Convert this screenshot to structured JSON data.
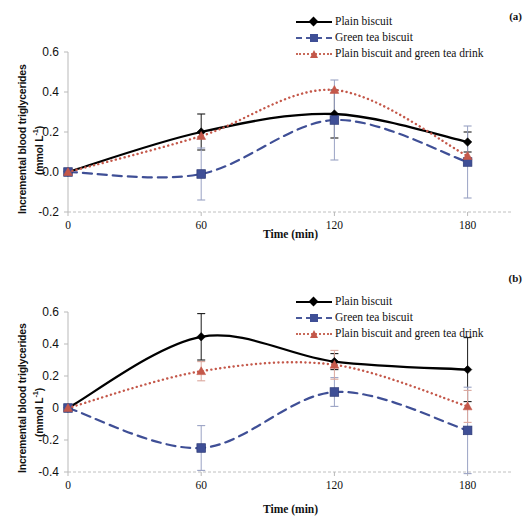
{
  "figure": {
    "panels": [
      {
        "tag": "(a)",
        "axis": {
          "y_label_line1": "Incremental blood triglycerides",
          "y_label_line2": "(mmol L",
          "y_label_sup": "-1",
          "y_label_line2_close": ")",
          "x_label": "Time (min)",
          "y_ticks": [
            "0.6",
            "0.4",
            "0.2",
            "0.0",
            "-0.2"
          ],
          "x_ticks": [
            "0",
            "60",
            "120",
            "180"
          ]
        },
        "legend": [
          {
            "label": "Plain biscuit",
            "style": "solid",
            "marker": "diamond",
            "color": "#000000"
          },
          {
            "label": "Green tea biscuit",
            "style": "dashed",
            "marker": "square",
            "color": "#3f4f96"
          },
          {
            "label": "Plain biscuit and green tea drink",
            "style": "dotted",
            "marker": "triangle",
            "color": "#c4584a"
          }
        ]
      },
      {
        "tag": "(b)",
        "axis": {
          "y_label_line1": "Incremental blood triglycerides",
          "y_label_line2": "(mmol L",
          "y_label_sup": "-1",
          "y_label_line2_close": ")",
          "x_label": "Time (min)",
          "y_ticks": [
            "0.6",
            "0.4",
            "0.2",
            "0",
            "-0.2",
            "-0.4"
          ],
          "x_ticks": [
            "0",
            "60",
            "120",
            "180"
          ]
        },
        "legend": [
          {
            "label": "Plain biscuit",
            "style": "solid",
            "marker": "diamond",
            "color": "#000000"
          },
          {
            "label": "Green tea biscuit",
            "style": "dashed",
            "marker": "square",
            "color": "#3f4f96"
          },
          {
            "label": "Plain biscuit and green tea drink",
            "style": "dotted",
            "marker": "triangle",
            "color": "#c4584a"
          }
        ]
      }
    ]
  },
  "chart_data": [
    {
      "type": "line",
      "panel": "(a)",
      "title": "",
      "xlabel": "Time (min)",
      "ylabel": "Incremental blood triglycerides (mmol L-1)",
      "x": [
        0,
        60,
        120,
        180
      ],
      "xlim": [
        0,
        200
      ],
      "ylim": [
        -0.2,
        0.6
      ],
      "yticks": [
        -0.2,
        0.0,
        0.2,
        0.4,
        0.6
      ],
      "xticks": [
        0,
        60,
        120,
        180
      ],
      "grid": false,
      "legend_position": "top-right",
      "smoothed": true,
      "series": [
        {
          "name": "Plain biscuit",
          "color": "#000000",
          "style": "solid",
          "marker": "diamond",
          "values": [
            0.0,
            0.2,
            0.29,
            0.15
          ],
          "errors": [
            0.0,
            0.09,
            0.12,
            0.05
          ]
        },
        {
          "name": "Green tea biscuit",
          "color": "#3f4f96",
          "style": "dashed",
          "marker": "square",
          "values": [
            0.0,
            -0.01,
            0.26,
            0.05
          ],
          "errors": [
            0.0,
            0.13,
            0.2,
            0.18
          ]
        },
        {
          "name": "Plain biscuit and green tea drink",
          "color": "#c4584a",
          "style": "dotted",
          "marker": "triangle",
          "values": [
            0.0,
            0.18,
            0.41,
            0.08
          ]
        }
      ]
    },
    {
      "type": "line",
      "panel": "(b)",
      "title": "",
      "xlabel": "Time (min)",
      "ylabel": "Incremental blood triglycerides (mmol L-1)",
      "x": [
        0,
        60,
        120,
        180
      ],
      "xlim": [
        0,
        200
      ],
      "ylim": [
        -0.4,
        0.6
      ],
      "yticks": [
        -0.4,
        -0.2,
        0.0,
        0.2,
        0.4,
        0.6
      ],
      "xticks": [
        0,
        60,
        120,
        180
      ],
      "grid": false,
      "legend_position": "top-right",
      "smoothed": true,
      "series": [
        {
          "name": "Plain biscuit",
          "color": "#000000",
          "style": "solid",
          "marker": "diamond",
          "values": [
            0.0,
            0.445,
            0.29,
            0.24
          ],
          "errors": [
            0.0,
            0.145,
            0.05,
            0.2
          ]
        },
        {
          "name": "Green tea biscuit",
          "color": "#3f4f96",
          "style": "dashed",
          "marker": "square",
          "values": [
            0.0,
            -0.25,
            0.1,
            -0.14
          ],
          "errors": [
            0.0,
            0.14,
            0.09,
            0.27
          ]
        },
        {
          "name": "Plain biscuit and green tea drink",
          "color": "#c4584a",
          "style": "dotted",
          "marker": "triangle",
          "values": [
            0.0,
            0.23,
            0.27,
            0.01
          ],
          "errors": [
            0.0,
            0.06,
            0.09,
            0.1
          ]
        }
      ]
    }
  ]
}
